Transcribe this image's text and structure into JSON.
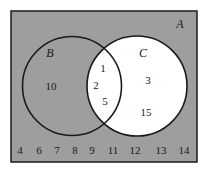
{
  "diagram": {
    "type": "venn",
    "colors": {
      "universe_fill": "#9e9e9e",
      "circle_c_fill": "#ffffff",
      "stroke": "#1a1a1a"
    },
    "universe": {
      "label": "A"
    },
    "sets": {
      "B": {
        "label": "B",
        "only": [
          "10"
        ]
      },
      "C": {
        "label": "C",
        "only": [
          "3",
          "15"
        ]
      },
      "intersection": [
        "1",
        "2",
        "5"
      ]
    },
    "outside": [
      "4",
      "6",
      "7",
      "8",
      "9",
      "11",
      "12",
      "13",
      "14"
    ]
  }
}
